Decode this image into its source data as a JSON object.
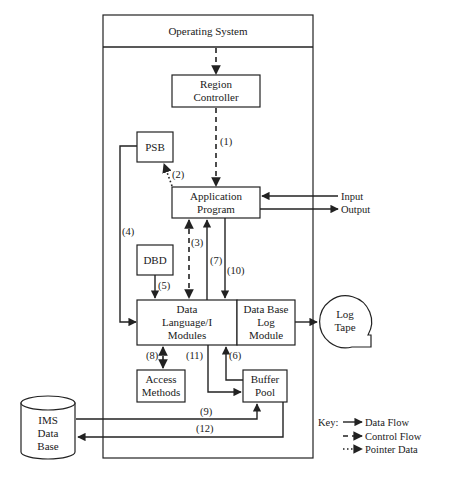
{
  "diagram": {
    "system": {
      "title": "Operating System"
    },
    "nodes": {
      "region_controller": [
        "Region",
        "Controller"
      ],
      "psb": "PSB",
      "application_program": [
        "Application",
        "Program"
      ],
      "dbd": "DBD",
      "dl1_modules": [
        "Data",
        "Language/I",
        "Modules"
      ],
      "log_module": [
        "Data Base",
        "Log",
        "Module"
      ],
      "access_methods": [
        "Access",
        "Methods"
      ],
      "buffer_pool": [
        "Buffer",
        "Pool"
      ],
      "ims_database": [
        "IMS",
        "Data",
        "Base"
      ],
      "log_tape": [
        "Log",
        "Tape"
      ]
    },
    "io": {
      "input": "Input",
      "output": "Output"
    },
    "edges": [
      {
        "id": "1",
        "label": "(1)",
        "from": "Region Controller",
        "to": "Application Program",
        "type": "control"
      },
      {
        "id": "2",
        "label": "(2)",
        "from": "Application Program",
        "to": "PSB",
        "type": "pointer"
      },
      {
        "id": "3",
        "label": "(3)",
        "from": "Application Program",
        "to": "Data Language/I Modules",
        "type": "control",
        "bidirectional": true
      },
      {
        "id": "4",
        "label": "(4)",
        "from": "PSB",
        "to": "Data Language/I Modules",
        "type": "data"
      },
      {
        "id": "5",
        "label": "(5)",
        "from": "DBD",
        "to": "Data Language/I Modules",
        "type": "data"
      },
      {
        "id": "6",
        "label": "(6)",
        "from": "Buffer Pool",
        "to": "Data Language/I Modules",
        "type": "data"
      },
      {
        "id": "7",
        "label": "(7)",
        "from": "Data Language/I Modules",
        "to": "Application Program",
        "type": "data"
      },
      {
        "id": "8",
        "label": "(8)",
        "from": "Data Language/I Modules",
        "to": "Access Methods",
        "type": "control",
        "bidirectional": true
      },
      {
        "id": "9",
        "label": "(9)",
        "from": "IMS Data Base",
        "to": "Buffer Pool",
        "type": "data"
      },
      {
        "id": "10",
        "label": "(10)",
        "from": "Application Program",
        "to": "Data Language/I Modules",
        "type": "data"
      },
      {
        "id": "11",
        "label": "(11)",
        "from": "Data Language/I Modules",
        "to": "Buffer Pool",
        "type": "data"
      },
      {
        "id": "12",
        "label": "(12)",
        "from": "Buffer Pool",
        "to": "IMS Data Base",
        "type": "data"
      }
    ],
    "key": {
      "title": "Key:",
      "items": [
        {
          "style": "data",
          "label": "Data Flow"
        },
        {
          "style": "control",
          "label": "Control Flow"
        },
        {
          "style": "pointer",
          "label": "Pointer Data"
        }
      ]
    }
  }
}
